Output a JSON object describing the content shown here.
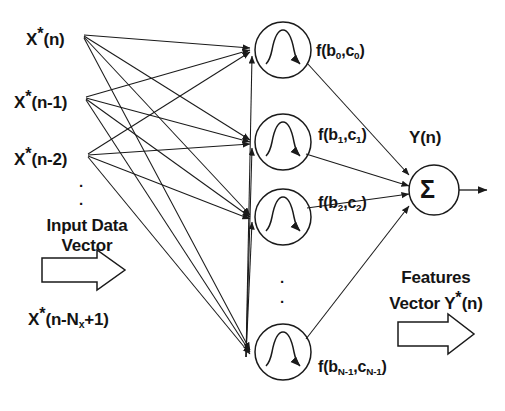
{
  "figure": {
    "kind": "neural-network-diagram"
  },
  "colors": {
    "stroke": "#1a1a1a",
    "text": "#141414",
    "background": "#ffffff"
  },
  "inputs": {
    "labels": [
      "X*(n)",
      "X*(n-1)",
      "X*(n-2)",
      "X*(n-Nx+1)"
    ],
    "label_parts": [
      {
        "base": "X",
        "star": "*",
        "tail": "(n)"
      },
      {
        "base": "X",
        "star": "*",
        "tail": "(n-1)"
      },
      {
        "base": "X",
        "star": "*",
        "tail": "(n-2)"
      },
      {
        "base": "X",
        "star": "*",
        "tail_pre": "(n-N",
        "sub": "x",
        "tail_post": "+1)"
      }
    ],
    "vertical_ellipsis": "·",
    "caption_line1": "Input Data",
    "caption_line2": "Vector",
    "arrow_direction": "right"
  },
  "hidden_layer": {
    "neuron_glyph": "bump-function",
    "neuron_count_shown": 4,
    "vertical_ellipsis": "·",
    "labels": [
      {
        "f": "f(b",
        "sub0": "0",
        "mid": ",c",
        "sub1": "0",
        "close": ")"
      },
      {
        "f": "f(b",
        "sub0": "1",
        "mid": ",c",
        "sub1": "1",
        "close": ")"
      },
      {
        "f": "f(b",
        "sub0": "2",
        "mid": ",c",
        "sub1": "2",
        "close": ")"
      },
      {
        "f": "f(b",
        "sub0": "N-1",
        "mid": ",c",
        "sub1": "N-1",
        "close": ")"
      }
    ],
    "labels_plain": [
      "f(b0,c0)",
      "f(b1,c1)",
      "f(b2,c2)",
      "f(bN-1,cN-1)"
    ]
  },
  "output": {
    "node_symbol": "Σ",
    "node_label": "Y(n)",
    "caption_line1": "Features",
    "caption_line2_pre": "Vector Y",
    "caption_line2_star": "*",
    "caption_line2_post": "(n)",
    "caption_line2_plain": "Vector Y*(n)",
    "arrow_direction": "right"
  }
}
